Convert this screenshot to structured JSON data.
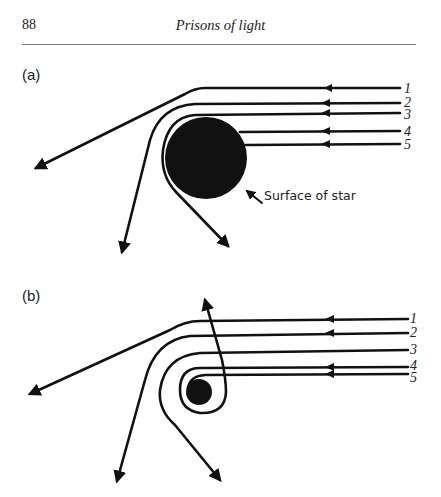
{
  "header": {
    "page_number": "88",
    "running_title": "Prisons of light"
  },
  "figure": {
    "panels": [
      {
        "label": "(a)",
        "ray_labels": [
          "1",
          "2",
          "3",
          "4",
          "5"
        ],
        "annotation": "Surface of star"
      },
      {
        "label": "(b)",
        "ray_labels": [
          "1",
          "2",
          "3",
          "4",
          "5"
        ]
      }
    ],
    "colors": {
      "ink": "#111111",
      "background": "#ffffff"
    }
  }
}
